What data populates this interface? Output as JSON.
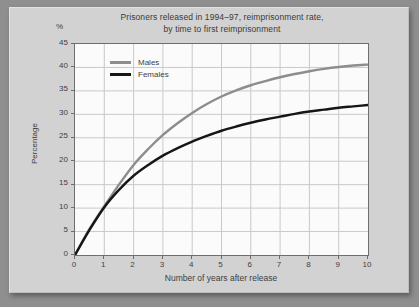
{
  "chart_data": {
    "type": "line",
    "title": "Prisoners released in 1994–97, reimprisonment rate,\nby time to first reimprisonment",
    "title_line1": "Prisoners released in 1994–97, reimprisonment rate,",
    "title_line2": "by time to first reimprisonment",
    "unit_label": "%",
    "xlabel": "Number of years after release",
    "ylabel": "Percentage",
    "xlim": [
      0,
      10
    ],
    "ylim": [
      0,
      45
    ],
    "grid": true,
    "legend_position": "upper left inside",
    "xticks": [
      "0",
      "1",
      "2",
      "3",
      "4",
      "5",
      "6",
      "7",
      "8",
      "9",
      "10"
    ],
    "yticks": [
      "0",
      "5",
      "10",
      "15",
      "20",
      "25",
      "30",
      "35",
      "40",
      "45"
    ],
    "x": [
      0,
      0.5,
      1,
      1.5,
      2,
      2.5,
      3,
      3.5,
      4,
      4.5,
      5,
      5.5,
      6,
      6.5,
      7,
      7.5,
      8,
      8.5,
      9,
      9.5,
      10
    ],
    "series": [
      {
        "name": "Males",
        "color": "#8d8d8d",
        "values": [
          0,
          5.6,
          10.4,
          15.0,
          19.2,
          22.6,
          25.6,
          28.1,
          30.3,
          32.2,
          33.8,
          35.1,
          36.2,
          37.1,
          37.9,
          38.6,
          39.2,
          39.7,
          40.1,
          40.4,
          40.6
        ]
      },
      {
        "name": "Females",
        "color": "#161616",
        "values": [
          0,
          5.4,
          10.2,
          13.9,
          16.9,
          19.2,
          21.2,
          22.8,
          24.2,
          25.4,
          26.5,
          27.4,
          28.2,
          28.9,
          29.5,
          30.1,
          30.6,
          31.0,
          31.4,
          31.7,
          32.0
        ]
      }
    ]
  },
  "legend": {
    "items": [
      {
        "label": "Males",
        "color": "#8d8d8d"
      },
      {
        "label": "Females",
        "color": "#161616"
      }
    ]
  }
}
